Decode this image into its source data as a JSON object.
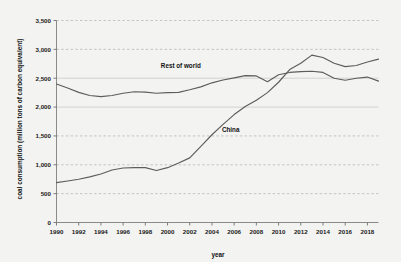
{
  "chart_data": {
    "type": "line",
    "title": "",
    "xlabel": "year",
    "ylabel": "coal consumption (million tons of carbon equivalent)",
    "xlim": [
      1990,
      2019
    ],
    "ylim": [
      0,
      3500
    ],
    "ytick_labels": [
      "0",
      "500",
      "1,000",
      "1,500",
      "2,000",
      "2,500",
      "3,000",
      "3,500"
    ],
    "ytick_values": [
      0,
      500,
      1000,
      1500,
      2000,
      2500,
      3000,
      3500
    ],
    "xtick_labels": [
      "1990",
      "1992",
      "1994",
      "1996",
      "1998",
      "2000",
      "2002",
      "2004",
      "2006",
      "2008",
      "2010",
      "2012",
      "2014",
      "2016",
      "2018"
    ],
    "xtick_values": [
      1990,
      1992,
      1994,
      1996,
      1998,
      2000,
      2002,
      2004,
      2006,
      2008,
      2010,
      2012,
      2014,
      2016,
      2018
    ],
    "grid": "horizontal-dashed",
    "legend": "inline-series-labels",
    "x": [
      1990,
      1991,
      1992,
      1993,
      1994,
      1995,
      1996,
      1997,
      1998,
      1999,
      2000,
      2001,
      2002,
      2003,
      2004,
      2005,
      2006,
      2007,
      2008,
      2009,
      2010,
      2011,
      2012,
      2013,
      2014,
      2015,
      2016,
      2017,
      2018,
      2019
    ],
    "series": [
      {
        "name": "Rest of world",
        "label": "Rest of world",
        "color": "#5d5d5d",
        "values": [
          2400,
          2330,
          2255,
          2200,
          2180,
          2200,
          2240,
          2265,
          2260,
          2240,
          2250,
          2255,
          2300,
          2350,
          2420,
          2470,
          2505,
          2545,
          2540,
          2440,
          2560,
          2600,
          2615,
          2620,
          2600,
          2500,
          2465,
          2500,
          2520,
          2450
        ]
      },
      {
        "name": "China",
        "label": "China",
        "color": "#9a9a9a",
        "values": [
          690,
          720,
          750,
          790,
          840,
          910,
          945,
          950,
          950,
          900,
          950,
          1030,
          1120,
          1320,
          1520,
          1700,
          1870,
          2010,
          2120,
          2250,
          2430,
          2650,
          2760,
          2900,
          2860,
          2760,
          2700,
          2720,
          2780,
          2830
        ]
      }
    ],
    "annotations": [
      {
        "text": "Rest of world",
        "x": 1999.4,
        "y": 2680
      },
      {
        "text": "China",
        "x": 2004.9,
        "y": 1560
      }
    ]
  }
}
